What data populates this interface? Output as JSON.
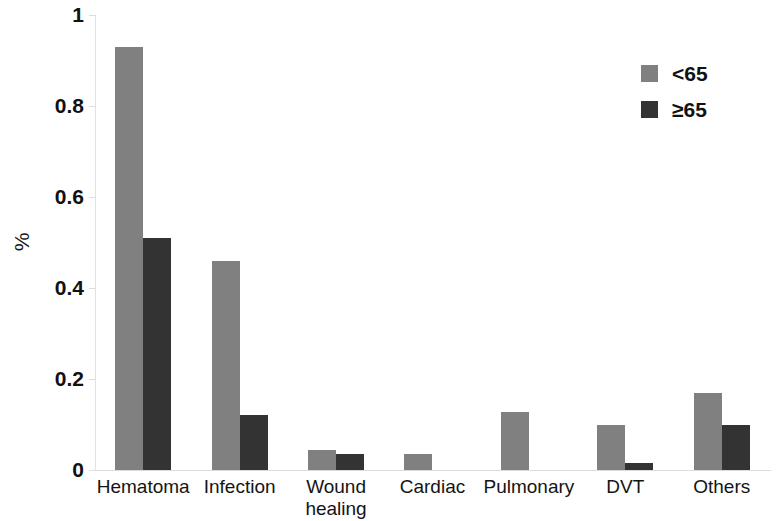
{
  "chart_data": {
    "type": "bar",
    "title": "",
    "subtitle": "",
    "xlabel": "",
    "ylabel": "%",
    "ylim": [
      0,
      1
    ],
    "yticks": [
      "0",
      "0.2",
      "0.4",
      "0.6",
      "0.8",
      "1"
    ],
    "ytick_values": [
      0,
      0.2,
      0.4,
      0.6,
      0.8,
      1
    ],
    "grid": false,
    "legend_position": "top-right",
    "categories": [
      "Hematoma",
      "Infection",
      "Wound\nhealing",
      "Cardiac",
      "Pulmonary",
      "DVT",
      "Others"
    ],
    "series": [
      {
        "name": "<65",
        "color": "#808080",
        "values": [
          0.93,
          0.46,
          0.045,
          0.035,
          0.128,
          0.1,
          0.17
        ]
      },
      {
        "name": "≥65",
        "color": "#333333",
        "values": [
          0.51,
          0.12,
          0.035,
          0,
          0,
          0.015,
          0.1
        ]
      }
    ]
  },
  "legend": {
    "items": [
      {
        "label": "<65",
        "color": "#808080"
      },
      {
        "label": "≥65",
        "color": "#333333"
      }
    ]
  },
  "axes": {
    "y_title": "%",
    "y_tick_labels": [
      "1",
      "0.8",
      "0.6",
      "0.4",
      "0.2",
      "0"
    ]
  }
}
